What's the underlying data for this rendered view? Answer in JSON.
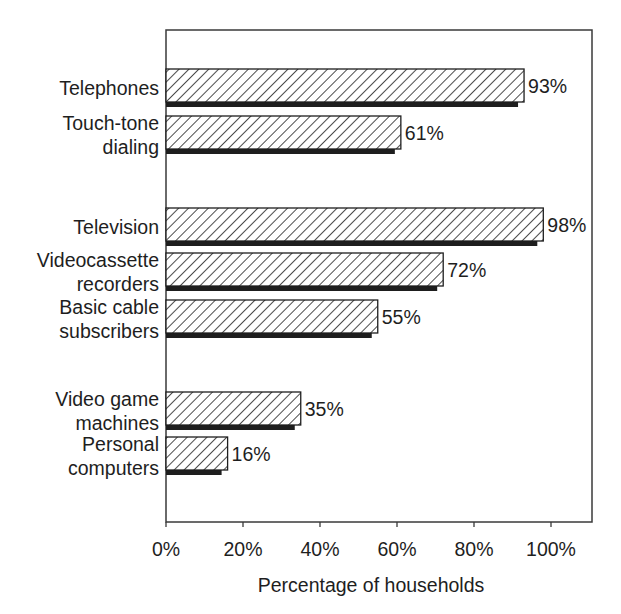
{
  "chart_data": {
    "type": "bar",
    "orientation": "horizontal",
    "title": "",
    "xlabel": "Percentage of households",
    "ylabel": "",
    "xlim": [
      0,
      100
    ],
    "x_ticks": [
      0,
      20,
      40,
      60,
      80,
      100
    ],
    "x_tick_labels": [
      "0%",
      "20%",
      "40%",
      "60%",
      "80%",
      "100%"
    ],
    "grid": false,
    "legend": null,
    "value_suffix": "%",
    "groups": [
      {
        "name": "telephone",
        "items": [
          {
            "label_lines": [
              "Telephones"
            ],
            "value": 93
          },
          {
            "label_lines": [
              "Touch-tone",
              "dialing"
            ],
            "value": 61
          }
        ]
      },
      {
        "name": "television",
        "items": [
          {
            "label_lines": [
              "Television"
            ],
            "value": 98
          },
          {
            "label_lines": [
              "Videocassette",
              "recorders"
            ],
            "value": 72
          },
          {
            "label_lines": [
              "Basic cable",
              "subscribers"
            ],
            "value": 55
          }
        ]
      },
      {
        "name": "computing",
        "items": [
          {
            "label_lines": [
              "Video game",
              "machines"
            ],
            "value": 35
          },
          {
            "label_lines": [
              "Personal",
              "computers"
            ],
            "value": 16
          }
        ]
      }
    ],
    "categories": [
      "Telephones",
      "Touch-tone dialing",
      "Television",
      "Videocassette recorders",
      "Basic cable subscribers",
      "Video game machines",
      "Personal computers"
    ],
    "values": [
      93,
      61,
      98,
      72,
      55,
      35,
      16
    ],
    "style": {
      "bar_fill": "hatched-diagonal",
      "hatch_color": "#1e1e1e",
      "shadow_color": "#1e1e1e",
      "frame_color": "#3a3a3a"
    }
  },
  "layout": {
    "plot_left": 166,
    "plot_right": 592,
    "plot_top": 30,
    "plot_bottom": 522,
    "scale_px_per_pct": 3.85,
    "bar_tops": [
      69,
      116,
      208,
      253,
      300,
      392,
      437
    ],
    "bar_height": 33,
    "shadow_height": 5,
    "shadow_offset_x": 6
  }
}
